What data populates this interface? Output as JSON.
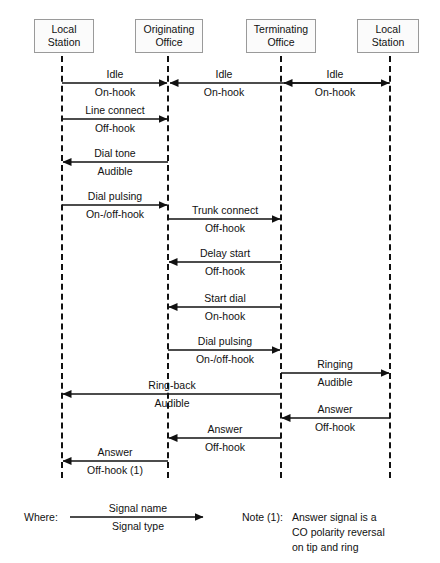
{
  "diagram": {
    "actors": [
      {
        "id": "local-station-left",
        "line1": "Local",
        "line2": "Station",
        "x": 62
      },
      {
        "id": "originating-office",
        "line1": "Originating",
        "line2": "Office",
        "x": 168
      },
      {
        "id": "terminating-office",
        "line1": "Terminating",
        "line2": "Office",
        "x": 281
      },
      {
        "id": "local-station-right",
        "line1": "Local",
        "line2": "Station",
        "x": 390
      }
    ],
    "messages": [
      {
        "id": "idle-1",
        "name": "Idle",
        "type": "On-hook",
        "from": 0,
        "to": 1,
        "y": 83,
        "direction": "right"
      },
      {
        "id": "idle-2",
        "name": "Idle",
        "type": "On-hook",
        "from": 1,
        "to": 2,
        "y": 83,
        "direction": "both-in"
      },
      {
        "id": "idle-3",
        "name": "Idle",
        "type": "On-hook",
        "from": 2,
        "to": 3,
        "y": 83,
        "direction": "both-in"
      },
      {
        "id": "line-connect",
        "name": "Line connect",
        "type": "Off-hook",
        "from": 0,
        "to": 1,
        "y": 119,
        "direction": "right"
      },
      {
        "id": "dial-tone",
        "name": "Dial tone",
        "type": "Audible",
        "from": 1,
        "to": 0,
        "y": 162,
        "direction": "left"
      },
      {
        "id": "dial-pulsing-1",
        "name": "Dial pulsing",
        "type": "On-/off-hook",
        "from": 0,
        "to": 1,
        "y": 205,
        "direction": "right"
      },
      {
        "id": "trunk-connect",
        "name": "Trunk connect",
        "type": "Off-hook",
        "from": 1,
        "to": 2,
        "y": 219,
        "direction": "right"
      },
      {
        "id": "delay-start",
        "name": "Delay start",
        "type": "Off-hook",
        "from": 2,
        "to": 1,
        "y": 262,
        "direction": "left"
      },
      {
        "id": "start-dial",
        "name": "Start dial",
        "type": "On-hook",
        "from": 2,
        "to": 1,
        "y": 307,
        "direction": "left"
      },
      {
        "id": "dial-pulsing-2",
        "name": "Dial pulsing",
        "type": "On-/off-hook",
        "from": 1,
        "to": 2,
        "y": 350,
        "direction": "right"
      },
      {
        "id": "ringing",
        "name": "Ringing",
        "type": "Audible",
        "from": 2,
        "to": 3,
        "y": 373,
        "direction": "right"
      },
      {
        "id": "ring-back",
        "name": "Ring-back",
        "type": "Audible",
        "from": 2,
        "to": 0,
        "y": 394,
        "direction": "left"
      },
      {
        "id": "answer-1",
        "name": "Answer",
        "type": "Off-hook",
        "from": 3,
        "to": 2,
        "y": 418,
        "direction": "left"
      },
      {
        "id": "answer-2",
        "name": "Answer",
        "type": "Off-hook",
        "from": 2,
        "to": 1,
        "y": 438,
        "direction": "left"
      },
      {
        "id": "answer-3",
        "name": "Answer",
        "type": "Off-hook (1)",
        "from": 1,
        "to": 0,
        "y": 461,
        "direction": "left"
      }
    ],
    "legend": {
      "where_label": "Where:",
      "signal_name": "Signal name",
      "signal_type": "Signal type"
    },
    "note": {
      "label": "Note (1):",
      "line1": "Answer signal is a",
      "line2": "CO polarity reversal",
      "line3": "on tip and ring"
    },
    "colors": {
      "ink": "#111111",
      "box_border": "#9a9a9a",
      "box_fill": "#fbfbfb",
      "background": "#ffffff"
    }
  }
}
